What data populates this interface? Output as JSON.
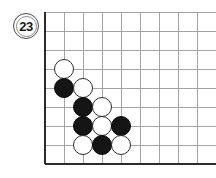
{
  "diagram": {
    "kind": "go-board-corner-diagram",
    "move_badge": {
      "label": "23",
      "name": "move-number-badge",
      "x": 13,
      "y": 13,
      "size": 26
    },
    "board": {
      "origin_x": 45,
      "origin_y": 164,
      "cell": 19.0,
      "cols": 9,
      "rows": 8,
      "stone_diameter": 20,
      "grid_color": "#9a9a9a",
      "edge_color": "#2b2b2b",
      "grid_line_width": 0.9,
      "edge_line_width": 2.6,
      "background": "#ffffff",
      "left_edge_label": "board-left-edge",
      "bottom_edge_label": "board-bottom-edge"
    },
    "colors": {
      "black_stone": "#151515",
      "white_stone": "#ffffff",
      "white_stone_border": "#2a2a2a",
      "badge_border": "#4a4a4a",
      "text": "#1a1a1a"
    },
    "stones": [
      {
        "color": "white",
        "col": 1,
        "row": 5,
        "name": "stone-white-b6"
      },
      {
        "color": "black",
        "col": 1,
        "row": 4,
        "name": "stone-black-b5"
      },
      {
        "color": "white",
        "col": 2,
        "row": 4,
        "name": "stone-white-c5"
      },
      {
        "color": "black",
        "col": 2,
        "row": 3,
        "name": "stone-black-c4"
      },
      {
        "color": "white",
        "col": 3,
        "row": 3,
        "name": "stone-white-d4"
      },
      {
        "color": "black",
        "col": 2,
        "row": 2,
        "name": "stone-black-c3"
      },
      {
        "color": "white",
        "col": 3,
        "row": 2,
        "name": "stone-white-d3"
      },
      {
        "color": "black",
        "col": 4,
        "row": 2,
        "name": "stone-black-e3"
      },
      {
        "color": "white",
        "col": 2,
        "row": 1,
        "name": "stone-white-c2"
      },
      {
        "color": "black",
        "col": 3,
        "row": 1,
        "name": "stone-black-d2"
      },
      {
        "color": "white",
        "col": 4,
        "row": 1,
        "name": "stone-white-e2"
      }
    ]
  }
}
